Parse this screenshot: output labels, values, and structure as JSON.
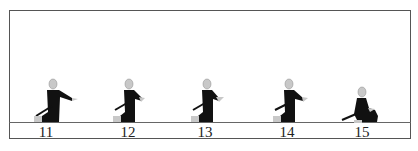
{
  "diagram": {
    "frames": [
      {
        "label": "11",
        "pose": "kneel-arm-extended"
      },
      {
        "label": "12",
        "pose": "kneel-hands-forward"
      },
      {
        "label": "13",
        "pose": "kneel-hands-forward"
      },
      {
        "label": "14",
        "pose": "kneel-arm-extended"
      },
      {
        "label": "15",
        "pose": "seated-sword-lowered"
      }
    ],
    "colors": {
      "figure": "#111111",
      "head": "#c8c8c8",
      "line": "#666666"
    }
  }
}
